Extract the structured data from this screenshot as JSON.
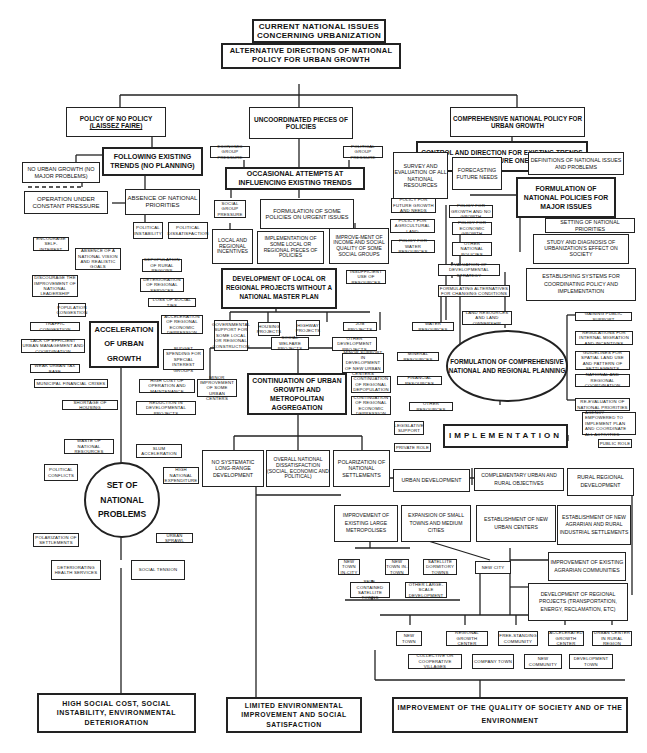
{
  "title": "Current national issues concerning urbanization",
  "nodes": {
    "root": "CURRENT NATIONAL ISSUES CONCERNING URBANIZATION",
    "alternatives": "ALTERNATIVE DIRECTIONS OF NATIONAL POLICY FOR URBAN GROWTH",
    "no_policy": "POLICY OF NO POLICY",
    "no_policy_sub": "(LAISSEZ FAIRE)",
    "uncoordinated": "UNCOORDINATED PIECES OF POLICIES",
    "comprehensive": "COMPREHENSIVE NATIONAL POLICY FOR URBAN GROWTH",
    "control_direction": "CONTROL AND DIRECTION FOR EXISTING TRENDS AND FUTURE ONES",
    "following_trends": "FOLLOWING EXISTING TRENDS (NO PLANNING)",
    "no_urban_growth": "NO URBAN GROWTH (NO MAJOR PROBLEMS)",
    "constant_pressure": "OPERATION UNDER CONSTANT PRESSURE",
    "absence_priorities": "ABSENCE OF NATIONAL PRIORITIES",
    "political_instability": "POLITICAL INSTABILITY",
    "political_dissatisfaction": "POLITICAL DISSATISFACTION",
    "encourage_self_interest": "ENCOURAGE SELF-INTEREST",
    "absence_vision": "ABSENCE OF A NATIONAL VISION AND REALISTIC GOALS",
    "discourage_leadership": "DISCOURAGE THE IMPROVEMENT OF NATIONAL LEADERSHIP",
    "depopulation_rural": "DEPOPULATION OF RURAL REGIONS",
    "deterioration_services": "DETERIORATION OF REGIONAL SERVICES",
    "loss_social_ties": "LOSS OF SOCIAL TIES",
    "population_congestion": "POPULATION CONGESTION",
    "traffic_congestion": "TRAFFIC CONGESTION",
    "lack_management": "LACK OF EFFICIENT URBAN MANAGEMENT AND COORDINATION",
    "weak_tax_base": "WEAK URBAN TAX BASE",
    "acceleration": "ACCELERATION OF URBAN GROWTH",
    "acceleration_depression": "ACCELERATION OF REGIONAL ECONOMIC DEPRESSION",
    "budget_spending": "BUDGET SPENDING FOR SPECIAL INTEREST GROUPS",
    "municipal_crises": "MUNICIPAL FINANCIAL CRISES",
    "shortage_housing": "SHORTAGE OF HOUSING",
    "high_cost": "HIGH COST OF OPERATION AND MAINTENANCE",
    "reduction_projects": "REDUCTION IN DEVELOPMENTAL PROJECTS",
    "economic_pressure": "ECONOMIC GROUP PRESSURE",
    "political_pressure": "POLITICAL GROUP PRESSURE",
    "occasional_attempts": "OCCASIONAL ATTEMPTS AT INFLUENCING EXISTING TRENDS",
    "social_pressure": "SOCIAL GROUP PRESSURE",
    "formulation_some": "FORMULATION OF SOME POLICIES ON URGENT ISSUES",
    "local_incentives": "LOCAL AND REGIONAL INCENTIVES",
    "implementation_some": "IMPLEMENTATION OF SOME LOCAL OR REGIONAL PIECES OF POLICIES",
    "improvement_income": "IMPROVE-MENT OF INCOME AND SOCIAL QUALITY OF SOME SOCIAL GROUPS",
    "development_local": "DEVELOPMENT OF LOCAL OR REGIONAL PROJECTS WITHOUT A NATIONAL MASTER PLAN",
    "insufficient_resources": "INSUFFICIENT USE OF RESOURCES",
    "gov_support": "GOVERNMENTAL SUPPORT FOR SOME LOCAL OR REGIONAL CONSTRUCTION",
    "housing_projects": "HOUSING PROJECTS",
    "highway_projects": "HIGHWAY PROJECTS",
    "social_welfare": "SOCIAL WELFARE PROJECTS",
    "job_projects": "JOB PROJECTS",
    "other_dev_projects": "OTHER DEVELOPMENT PROJECTS",
    "minor_support": "MINOR SUPPORT IN DEVELOPMENT OF NEW URBAN CENTERS",
    "minor_improvement": "MINOR IMPROVEMENT OF SOME URBAN CENTERS",
    "continuation": "CONTINUATION OF URBAN GROWTH AND METROPOLITAN AGGREGATION",
    "continuation_depop": "CONTINUATION OF REGIONAL DEPOPULATION",
    "continuation_depression": "CONTINUATION OF REGIONAL ECONOMIC DEPRESSION",
    "no_systematic": "NO SYSTEMATIC LONG-RANGE DEVELOPMENT",
    "overall_dissatisfaction": "OVERALL NATIONAL DISSATISFACTION (SOCIAL, ECONOMIC AND POLITICAL)",
    "polarization_settlements": "POLARIZATION OF NATIONAL SETTLEMENTS",
    "set_problems": "SET OF NATIONAL PROBLEMS",
    "waste_resources": "WASTE OF NATIONAL RESOURCES",
    "slum_acceleration": "SLUM ACCELERATION",
    "political_conflicts": "POLITICAL CONFLICTS",
    "high_expenditure": "HIGH NATIONAL EXPENDITURE",
    "polarization_of_settlements": "POLARIZATION OF SETTLEMENTS",
    "urban_sprawl": "URBAN SPRAWL",
    "deteriorating_health": "DETERIORATING HEALTH SERVICES",
    "social_tension": "SOCIAL TENSION",
    "high_social_cost": "HIGH SOCIAL COST, SOCIAL INSTABILITY, ENVIRONMENTAL DETERIORATION",
    "limited_improvement": "LIMITED ENVIRONMENTAL IMPROVEMENT AND SOCIAL SATISFACTION",
    "survey_resources": "SURVEY AND EVALUATION OF ALL NATIONAL RESOURCES",
    "forecasting": "FORECASTING FUTURE NEEDS",
    "definitions_issues": "DEFINITIONS OF NATIONAL ISSUES AND PROBLEMS",
    "formulation_national": "FORMULATION OF NATIONAL POLICIES FOR MAJOR ISSUES",
    "policy_future_growth": "POLICY FOR FUTURE GROWTH AND NEEDS",
    "policy_no_growth": "POLICY FOR GROWTH AND NO GROWTH",
    "policy_agricultural": "POLICY FOR AGRICULTURAL LAND",
    "policy_economic": "POLICY FOR ECONOMIC GROWTH",
    "policy_water": "POLICY FOR WATER RESOURCES",
    "other_national_policies": "OTHER NATIONAL POLICIES",
    "setting_priorities": "SETTING OF NATIONAL PRIORITIES",
    "study_diagnosis": "STUDY AND DIAGNOSIS OF URBANIZATION'S EFFECT ON SOCIETY",
    "evaluation_strategy": "EVALUATION OF DEVELOPMENTAL STRATEGY",
    "formulating_alternatives": "FORMULATING ALTERNATIVES FOR CHANGING CONDITIONS",
    "establishing_systems": "ESTABLISHING SYSTEMS FOR COORDINATING POLICY AND IMPLEMENTATION",
    "land_resources": "LAND RESOURCES AND LAND OWNERSHIP",
    "water_resources": "WATER RESOURCES",
    "mineral_resources": "MINERAL RESOURCES",
    "financial_resources": "FINANCIAL RESOURCES",
    "other_resources": "OTHER RESOURCES",
    "formulation_comprehensive": "FORMULATION OF COMPREHENSIVE NATIONAL AND REGIONAL PLANNING",
    "gaining_support": "GAINING PUBLIC SUPPORT",
    "regulations_migration": "REGULATIONS FOR INTERNAL MIGRATION AND INCENTIVES",
    "guidelines_land": "GUIDELINES FOR SPATIAL LAND USE AND PATTERN OF SETTLEMENTS",
    "national_regional_coord": "NATIONAL AND REGIONAL COORDINATION",
    "re_evaluation": "RE-EVALUATION OF NATIONAL PRIORITIES",
    "agency_empowered": "AGENCY EMPOWERED TO IMPLEMENT PLAN AND COORDINATE ALL ACTIVITIES",
    "legislative_support": "LEGISLATIVE SUPPORT",
    "implementation": "IMPLEMENTATION",
    "private_role": "PRIVATE ROLE",
    "public_role": "PUBLIC ROLE",
    "urban_development": "URBAN DEVELOPMENT",
    "complementary": "COMPLEMENTARY URBAN AND RURAL OBJECTIVES",
    "rural_regional": "RURAL REGIONAL DEVELOPMENT",
    "improvement_metropolises": "IMPROVEMENT OF EXISTING LARGE METROPOLISES",
    "expansion_small": "EXPANSION OF SMALL TOWNS AND MEDIUM CITIES",
    "establishment_urban": "ESTABLISHMENT OF NEW URBAN CENTERS",
    "establishment_agrarian": "ESTABLISHMENT OF NEW AGRARIAN AND RURAL INDUSTRIAL SETTLEMENTS",
    "improvement_agrarian": "IMPROVEMENT OF EXISTING AGRARIAN COMMUNITIES",
    "development_regional": "DEVELOPMENT OF REGIONAL PROJECTS (TRANSPORTATION, ENERGY, RECLAMATION, ETC)",
    "new_town_in_city": "NEW TOWN IN-CITY",
    "new_town_in_town": "NEW TOWN IN-TOWN",
    "satellite_dormitory": "SATELLITE DORMITORY TOWNS",
    "new_city": "NEW CITY",
    "self_contained": "SELF-CONTAINED SATELLITE TOWNS",
    "other_large_scale": "OTHER LARGE-SCALE DEVELOPMENT",
    "new_town": "NEW TOWN",
    "regional_growth_center": "REGIONAL GROWTH CENTER",
    "free_standing": "FREE-STANDING COMMUNITY",
    "accelerated_growth": "ACCELERATED GROWTH CENTER",
    "urban_center_rural": "URBAN CENTER IN RURAL REGION",
    "collective_villages": "COLLECTIVE OR COOPERATIVE VILLAGES",
    "company_town": "COMPANY TOWN",
    "new_community": "NEW COMMUNITY",
    "development_town": "DEVELOPMENT TOWN",
    "improvement_quality": "IMPROVEMENT OF THE QUALITY OF SOCIETY AND OF THE ENVIRONMENT"
  },
  "colors": {
    "line": "#222222",
    "box_fill": "#ffffff",
    "background": "#ffffff"
  }
}
